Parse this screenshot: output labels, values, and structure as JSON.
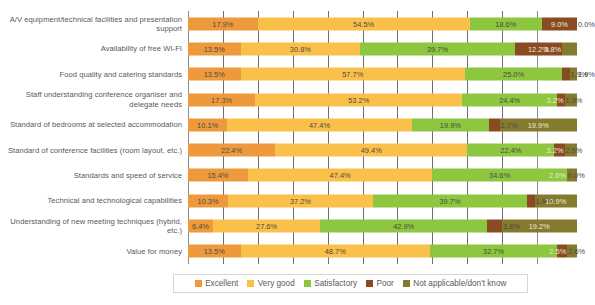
{
  "chart_data": {
    "type": "bar",
    "subtype": "stacked-horizontal-100",
    "title": "",
    "xlabel": "",
    "ylabel": "",
    "xlim": [
      0,
      100
    ],
    "grid": true,
    "gridline_interval": 10,
    "legend_position": "bottom",
    "categories": [
      "A/V equipment/technical facilities and presentation support",
      "Availability of free WI-FI",
      "Food quality and catering standards",
      "Staff understanding conference organiser and delegate needs",
      "Standard of bedrooms at selected accommodation",
      "Standard of conference facilities (room layout, etc.)",
      "Standards and speed of service",
      "Technical and technological capabilities",
      "Understanding of new meeting techniques (hybrid, etc.)",
      "Value for money"
    ],
    "series": [
      {
        "name": "Excellent",
        "color": "#EE9A3C",
        "values": [
          17.9,
          13.5,
          13.5,
          17.3,
          10.1,
          22.4,
          15.4,
          10.3,
          6.4,
          13.5
        ]
      },
      {
        "name": "Very good",
        "color": "#FBC04A",
        "values": [
          54.5,
          30.8,
          57.7,
          53.2,
          47.4,
          49.4,
          47.4,
          37.2,
          27.6,
          48.7
        ]
      },
      {
        "name": "Satisfactory",
        "color": "#8DC63F",
        "values": [
          18.6,
          39.7,
          25.0,
          24.4,
          19.9,
          22.4,
          34.6,
          39.7,
          42.9,
          32.7
        ]
      },
      {
        "name": "Poor",
        "color": "#8A4B22",
        "values": [
          9.0,
          12.2,
          1.9,
          1.9,
          2.7,
          2.6,
          0.0,
          1.9,
          3.8,
          2.6
        ]
      },
      {
        "name": "Not applicable/don't know",
        "color": "#857B2E",
        "values": [
          0.0,
          3.8,
          1.9,
          3.2,
          19.9,
          3.2,
          2.6,
          10.9,
          19.2,
          2.5
        ]
      }
    ],
    "value_labels": [
      [
        "17.9%",
        "54.5%",
        "18.6%",
        "9.0%",
        "0.0%"
      ],
      [
        "13.5%",
        "30.8%",
        "39.7%",
        "12.2%",
        "3.8%"
      ],
      [
        "13.5%",
        "57.7%",
        "25.0%",
        "1.9%",
        "1.9%"
      ],
      [
        "17.3%",
        "53.2%",
        "24.4%",
        "1.9%",
        "3.2%"
      ],
      [
        "10.1%",
        "47.4%",
        "19.9%",
        "2.7%",
        "19.9%"
      ],
      [
        "22.4%",
        "49.4%",
        "22.4%",
        "2.6%",
        "3.2%"
      ],
      [
        "15.4%",
        "47.4%",
        "34.6%",
        "0.0%",
        "2.6%"
      ],
      [
        "10.3%",
        "37.2%",
        "39.7%",
        "1.9%",
        "10.9%"
      ],
      [
        "6.4%",
        "27.6%",
        "42.9%",
        "3.8%",
        "19.2%"
      ],
      [
        "13.5%",
        "48.7%",
        "32.7%",
        "2.6%",
        "2.5%"
      ]
    ]
  },
  "legend": {
    "items": [
      {
        "label": "Excellent",
        "color": "#EE9A3C"
      },
      {
        "label": "Very good",
        "color": "#FBC04A"
      },
      {
        "label": "Satisfactory",
        "color": "#8DC63F"
      },
      {
        "label": "Poor",
        "color": "#8A4B22"
      },
      {
        "label": "Not applicable/don't know",
        "color": "#857B2E"
      }
    ]
  }
}
